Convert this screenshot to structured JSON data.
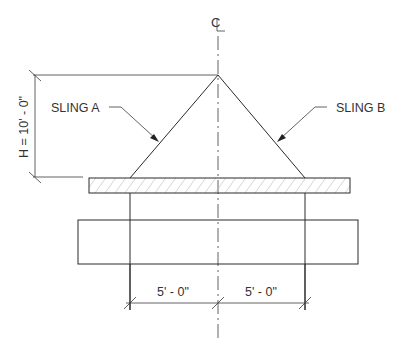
{
  "diagram": {
    "type": "rigging sling angle drawing",
    "centerline_label": "CL",
    "height_dimension": "H = 10' - 0\"",
    "sling_a_label": "SLING A",
    "sling_b_label": "SLING B",
    "left_span_dimension": "5' - 0\"",
    "right_span_dimension": "5' - 0\"",
    "colors": {
      "line": "#2a2a2a",
      "hatch": "#b8b8b8",
      "background": "#ffffff"
    }
  }
}
